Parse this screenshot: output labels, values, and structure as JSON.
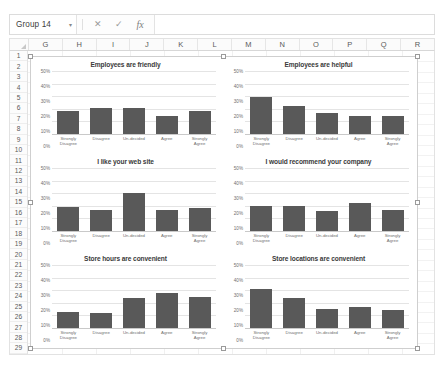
{
  "app": {
    "name_box_value": "Group 14",
    "name_box_arrow": "▾",
    "cancel_icon": "✕",
    "confirm_icon": "✓",
    "function_icon": "fx",
    "formula_value": ""
  },
  "sheet": {
    "columns": [
      "G",
      "H",
      "I",
      "J",
      "K",
      "L",
      "M",
      "N",
      "O",
      "P",
      "Q",
      "R"
    ],
    "rows": [
      1,
      2,
      3,
      4,
      5,
      6,
      7,
      8,
      9,
      10,
      11,
      12,
      13,
      14,
      15,
      16,
      17,
      18,
      19,
      20,
      21,
      22,
      23,
      24,
      25,
      26,
      27,
      28,
      29
    ]
  },
  "caption": "",
  "chart_common": {
    "categories": [
      "Strongly Disagree",
      "Disagree",
      "Un-decided",
      "Agree",
      "Strongly Agree"
    ],
    "yticks": [
      "50%",
      "40%",
      "30%",
      "20%",
      "10%",
      "0%"
    ],
    "ylim": [
      0,
      50
    ],
    "bar_color": "#595959",
    "grid": true,
    "legend": "none"
  },
  "chart_data": [
    {
      "type": "bar",
      "title": "Employees are friendly",
      "categories": [
        "Strongly Disagree",
        "Disagree",
        "Un-decided",
        "Agree",
        "Strongly Agree"
      ],
      "values": [
        18,
        21,
        21,
        14,
        18
      ],
      "xlabel": "",
      "ylabel": "",
      "ylim": [
        0,
        50
      ],
      "yticks": [
        0,
        10,
        20,
        30,
        40,
        50
      ]
    },
    {
      "type": "bar",
      "title": "Employees are helpful",
      "categories": [
        "Strongly Disagree",
        "Disagree",
        "Un-decided",
        "Agree",
        "Strongly Agree"
      ],
      "values": [
        29,
        22,
        17,
        14,
        14
      ],
      "xlabel": "",
      "ylabel": "",
      "ylim": [
        0,
        50
      ],
      "yticks": [
        0,
        10,
        20,
        30,
        40,
        50
      ]
    },
    {
      "type": "bar",
      "title": "I like your web site",
      "categories": [
        "Strongly Disagree",
        "Disagree",
        "Un-decided",
        "Agree",
        "Strongly Agree"
      ],
      "values": [
        19,
        17,
        30,
        17,
        18
      ],
      "xlabel": "",
      "ylabel": "",
      "ylim": [
        0,
        50
      ],
      "yticks": [
        0,
        10,
        20,
        30,
        40,
        50
      ]
    },
    {
      "type": "bar",
      "title": "I would recommend your company",
      "categories": [
        "Strongly Disagree",
        "Disagree",
        "Un-decided",
        "Agree",
        "Strongly Agree"
      ],
      "values": [
        20,
        20,
        16,
        22,
        17
      ],
      "xlabel": "",
      "ylabel": "",
      "ylim": [
        0,
        50
      ],
      "yticks": [
        0,
        10,
        20,
        30,
        40,
        50
      ]
    },
    {
      "type": "bar",
      "title": "Store hours are convenient",
      "categories": [
        "Strongly Disagree",
        "Disagree",
        "Un-decided",
        "Agree",
        "Strongly Agree"
      ],
      "values": [
        13,
        12,
        24,
        28,
        25
      ],
      "xlabel": "",
      "ylabel": "",
      "ylim": [
        0,
        50
      ],
      "yticks": [
        0,
        10,
        20,
        30,
        40,
        50
      ]
    },
    {
      "type": "bar",
      "title": "Store locations are convenient",
      "categories": [
        "Strongly Disagree",
        "Disagree",
        "Un-decided",
        "Agree",
        "Strongly Agree"
      ],
      "values": [
        31,
        24,
        15,
        17,
        14
      ],
      "xlabel": "",
      "ylabel": "",
      "ylim": [
        0,
        50
      ],
      "yticks": [
        0,
        10,
        20,
        30,
        40,
        50
      ]
    }
  ]
}
